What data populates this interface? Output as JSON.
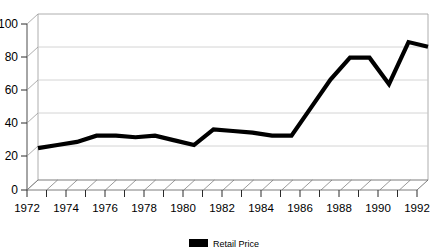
{
  "chart_data": {
    "type": "line",
    "title": "",
    "xlabel": "",
    "ylabel": "",
    "ylim": [
      0,
      100
    ],
    "xlim": [
      1972,
      1992
    ],
    "grid": true,
    "legend_position": "bottom-center",
    "style": "3d-perspective-line",
    "x": [
      1972,
      1973,
      1974,
      1975,
      1976,
      1977,
      1978,
      1979,
      1980,
      1981,
      1982,
      1983,
      1984,
      1985,
      1986,
      1987,
      1988,
      1989,
      1990,
      1991,
      1992
    ],
    "series": [
      {
        "name": "Retail Price",
        "color": "#000000",
        "values": [
          14,
          16,
          18,
          22,
          22,
          21,
          22,
          19,
          16,
          26,
          25,
          24,
          22,
          22,
          40,
          58,
          72,
          72,
          55,
          82,
          79
        ]
      }
    ],
    "y_ticks": [
      0,
      20,
      40,
      60,
      80,
      100
    ],
    "y_tick_labels": [
      "0",
      "20",
      "40",
      "60",
      "80",
      "100"
    ],
    "x_ticks": [
      1972,
      1973,
      1974,
      1975,
      1976,
      1977,
      1978,
      1979,
      1980,
      1981,
      1982,
      1983,
      1984,
      1985,
      1986,
      1987,
      1988,
      1989,
      1990,
      1991,
      1992
    ],
    "x_tick_labels": [
      "1972",
      "",
      "1974",
      "",
      "1976",
      "",
      "1978",
      "",
      "1980",
      "",
      "1982",
      "",
      "1984",
      "",
      "1986",
      "",
      "1988",
      "",
      "1990",
      "",
      "1992"
    ],
    "x_labels_shown": [
      "1972",
      "1974",
      "1976",
      "1978",
      "1980",
      "1982",
      "1984",
      "1986",
      "1988",
      "1990",
      "1992"
    ]
  },
  "legend": {
    "entries": [
      {
        "label": "Retail Price",
        "color": "#000000"
      }
    ]
  },
  "axes": {
    "y_tick_labels": [
      "100",
      "80",
      "60",
      "40",
      "20",
      "0"
    ],
    "x_tick_labels": [
      "1972",
      "1974",
      "1976",
      "1978",
      "1980",
      "1982",
      "1984",
      "1986",
      "1988",
      "1990",
      "1992"
    ]
  },
  "colors": {
    "series": "#000000",
    "grid": "#c9c9c9",
    "axis": "#4d4d4d",
    "background": "#ffffff"
  }
}
